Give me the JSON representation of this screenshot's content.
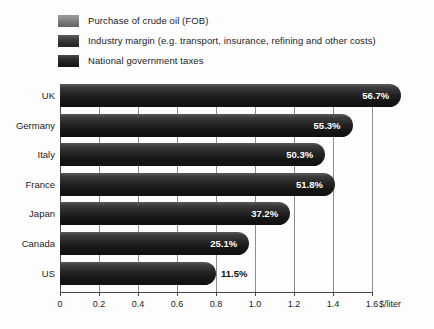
{
  "chart_data": {
    "type": "bar",
    "orientation": "horizontal",
    "stacked": true,
    "title": "",
    "xlabel": "$/liter",
    "ylabel": "",
    "xlim": [
      0,
      1.8
    ],
    "xticks": [
      "0",
      "0.2",
      "0.4",
      "0.6",
      "0.8",
      "1.0",
      "1.2",
      "1.4",
      "1.6"
    ],
    "xtick_values": [
      0,
      0.2,
      0.4,
      0.6,
      0.8,
      1.0,
      1.2,
      1.4,
      1.6
    ],
    "grid": true,
    "legend_position": "top-left",
    "categories": [
      "UK",
      "Germany",
      "Italy",
      "France",
      "Japan",
      "Canada",
      "US"
    ],
    "series": [
      {
        "name": "Purchase of crude oil (FOB)",
        "color": "#8b8b8b",
        "values": [
          0.58,
          0.58,
          0.58,
          0.58,
          0.58,
          0.58,
          0.58
        ]
      },
      {
        "name": "Industry margin (e.g. transport, insurance, refining and other costs)",
        "color": "#2f2f2f",
        "values": [
          0.1,
          0.1,
          0.1,
          0.1,
          0.1,
          0.1,
          0.1
        ]
      },
      {
        "name": "National government taxes",
        "color": "#141414",
        "values": [
          1.07,
          0.82,
          0.68,
          0.73,
          0.5,
          0.29,
          0.12
        ]
      }
    ],
    "totals": [
      1.75,
      1.5,
      1.36,
      1.41,
      1.18,
      0.97,
      0.8
    ],
    "data_labels": [
      "56.7%",
      "55.3%",
      "50.3%",
      "51.8%",
      "37.2%",
      "25.1%",
      "11.5%"
    ],
    "data_label_note": "National government taxes as share of total price"
  },
  "legend": {
    "items": [
      {
        "label": "Purchase of crude oil (FOB)",
        "swatch": "crude"
      },
      {
        "label": "Industry margin (e.g. transport, insurance, refining and other costs)",
        "swatch": "margin"
      },
      {
        "label": "National government taxes",
        "swatch": "taxes"
      }
    ]
  },
  "axis": {
    "unit_label": "$/liter"
  }
}
